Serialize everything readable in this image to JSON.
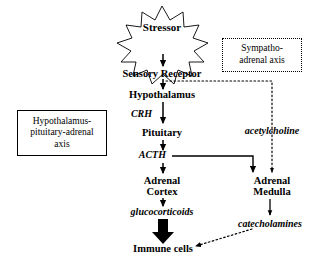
{
  "diagram": {
    "background_color": "#ffffff",
    "line_color": "#000000"
  },
  "burst": {
    "label": "Stressor",
    "shape": "starburst",
    "points": 12
  },
  "hpa_axis_box": {
    "label": "Hypothalamus-pituitary-adrenal axis",
    "line1": "Hypothalamus-",
    "line2": "pituitary-adrenal",
    "line3": "axis",
    "border_style": "solid"
  },
  "sam_axis_box": {
    "label": "Sympatho-adrenal axis",
    "line1": "Sympatho-",
    "line2": "adrenal axis",
    "border_style": "dotted"
  },
  "central_chain": {
    "sensory_receptor": "Sensory Receptor",
    "hypothalamus": "Hypothalamus",
    "crh": "CRH",
    "pituitary": "Pituitary",
    "acth": "ACTH",
    "adrenal_cortex_line1": "Adrenal",
    "adrenal_cortex_line2": "Cortex",
    "glucocorticoids": "glucocorticoids",
    "immune_cells": "Immune cells"
  },
  "sympathetic_chain": {
    "acetylcholine": "acetylcholine",
    "adrenal_medulla_line1": "Adrenal",
    "adrenal_medulla_line2": "Medulla",
    "catecholamines": "catecholamines"
  },
  "connectors": [
    {
      "name": "stressor-to-sensory-receptor",
      "style": "solid",
      "direction": "down"
    },
    {
      "name": "sensory-receptor-to-hypothalamus",
      "style": "solid",
      "direction": "down"
    },
    {
      "name": "hypothalamus-to-pituitary",
      "style": "solid",
      "direction": "down",
      "label": "CRH"
    },
    {
      "name": "pituitary-to-acth",
      "style": "solid",
      "direction": "down"
    },
    {
      "name": "acth-to-adrenal-cortex",
      "style": "solid",
      "direction": "down"
    },
    {
      "name": "acth-to-adrenal-medulla",
      "style": "solid",
      "direction": "right-then-down"
    },
    {
      "name": "adrenal-cortex-to-glucocorticoids",
      "style": "solid",
      "direction": "down"
    },
    {
      "name": "glucocorticoids-to-immune-cells",
      "style": "solid-thick",
      "direction": "down"
    },
    {
      "name": "sensory-receptor-to-adrenal-medulla",
      "style": "dotted",
      "direction": "right-then-down",
      "label": "acetylcholine"
    },
    {
      "name": "adrenal-medulla-to-catecholamines",
      "style": "solid",
      "direction": "down"
    },
    {
      "name": "catecholamines-to-immune-cells",
      "style": "dotted",
      "direction": "diagonal-down-left"
    }
  ]
}
